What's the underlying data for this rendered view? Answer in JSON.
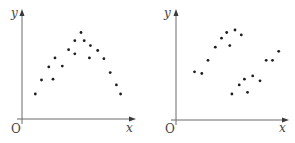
{
  "chart_data": [
    {
      "type": "scatter",
      "title": "",
      "xlabel": "x",
      "ylabel": "y",
      "origin_label": "O",
      "xlim": [
        0,
        100
      ],
      "ylim": [
        0,
        100
      ],
      "grid": false,
      "legend": "none",
      "scale_note": "Axes have no ticks or numeric labels in the figure; values are normalized relative positions on an assumed 0-100 range, not measured data.",
      "points": [
        {
          "x": 7,
          "y": 22
        },
        {
          "x": 13,
          "y": 39
        },
        {
          "x": 20,
          "y": 55
        },
        {
          "x": 24,
          "y": 40
        },
        {
          "x": 26,
          "y": 66
        },
        {
          "x": 33,
          "y": 56
        },
        {
          "x": 39,
          "y": 76
        },
        {
          "x": 45,
          "y": 87
        },
        {
          "x": 45,
          "y": 71
        },
        {
          "x": 51,
          "y": 97
        },
        {
          "x": 54,
          "y": 87
        },
        {
          "x": 59,
          "y": 66
        },
        {
          "x": 60,
          "y": 81
        },
        {
          "x": 67,
          "y": 75
        },
        {
          "x": 73,
          "y": 65
        },
        {
          "x": 79,
          "y": 48
        },
        {
          "x": 85,
          "y": 33
        },
        {
          "x": 89,
          "y": 22
        }
      ]
    },
    {
      "type": "scatter",
      "title": "",
      "xlabel": "x",
      "ylabel": "y",
      "origin_label": "O",
      "xlim": [
        0,
        100
      ],
      "ylim": [
        0,
        100
      ],
      "grid": false,
      "legend": "none",
      "scale_note": "Axes have no ticks or numeric labels in the figure; values are normalized relative positions on an assumed 0-100 range, not measured data.",
      "points": [
        {
          "x": 12,
          "y": 49
        },
        {
          "x": 19,
          "y": 47
        },
        {
          "x": 25,
          "y": 63
        },
        {
          "x": 32,
          "y": 79
        },
        {
          "x": 38,
          "y": 90
        },
        {
          "x": 43,
          "y": 97
        },
        {
          "x": 46,
          "y": 81
        },
        {
          "x": 51,
          "y": 100
        },
        {
          "x": 57,
          "y": 94
        },
        {
          "x": 48,
          "y": 22
        },
        {
          "x": 55,
          "y": 33
        },
        {
          "x": 60,
          "y": 40
        },
        {
          "x": 63,
          "y": 24
        },
        {
          "x": 68,
          "y": 44
        },
        {
          "x": 75,
          "y": 38
        },
        {
          "x": 81,
          "y": 63
        },
        {
          "x": 87,
          "y": 63
        },
        {
          "x": 93,
          "y": 74
        }
      ]
    }
  ]
}
